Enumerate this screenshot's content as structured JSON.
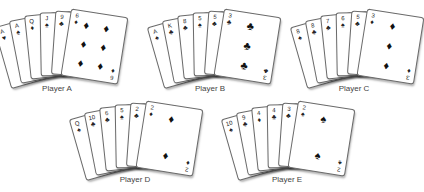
{
  "hands": [
    {
      "label": "Player A",
      "cards": [
        {
          "rank": "A",
          "suit": "♥"
        },
        {
          "rank": "A",
          "suit": "♠"
        },
        {
          "rank": "Q",
          "suit": "♦"
        },
        {
          "rank": "J",
          "suit": "♠"
        },
        {
          "rank": "9",
          "suit": "♣"
        },
        {
          "rank": "6",
          "suit": "♦"
        }
      ]
    },
    {
      "label": "Player B",
      "cards": [
        {
          "rank": "A",
          "suit": "♠"
        },
        {
          "rank": "K",
          "suit": "♣"
        },
        {
          "rank": "8",
          "suit": "♣"
        },
        {
          "rank": "5",
          "suit": "♠"
        },
        {
          "rank": "5",
          "suit": "♣"
        },
        {
          "rank": "3",
          "suit": "♣"
        }
      ]
    },
    {
      "label": "Player C",
      "cards": [
        {
          "rank": "8",
          "suit": "♠"
        },
        {
          "rank": "8",
          "suit": "♣"
        },
        {
          "rank": "7",
          "suit": "♣"
        },
        {
          "rank": "6",
          "suit": "♠"
        },
        {
          "rank": "5",
          "suit": "♣"
        },
        {
          "rank": "3",
          "suit": "♦"
        }
      ]
    },
    {
      "label": "Player D",
      "cards": [
        {
          "rank": "Q",
          "suit": "♠"
        },
        {
          "rank": "10",
          "suit": "♣"
        },
        {
          "rank": "6",
          "suit": "♣"
        },
        {
          "rank": "5",
          "suit": "♠"
        },
        {
          "rank": "2",
          "suit": "♣"
        },
        {
          "rank": "2",
          "suit": "♦"
        }
      ]
    },
    {
      "label": "Player E",
      "cards": [
        {
          "rank": "10",
          "suit": "♠"
        },
        {
          "rank": "9",
          "suit": "♣"
        },
        {
          "rank": "4",
          "suit": "♦"
        },
        {
          "rank": "4",
          "suit": "♣"
        },
        {
          "rank": "3",
          "suit": "♣"
        },
        {
          "rank": "2",
          "suit": "♠"
        }
      ]
    }
  ]
}
